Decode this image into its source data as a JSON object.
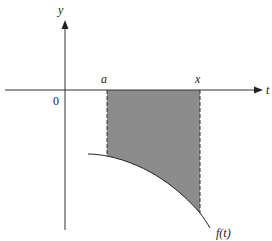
{
  "diagram": {
    "type": "area-under-curve",
    "axes": {
      "x_label": "t",
      "y_label": "y",
      "origin_label": "0"
    },
    "bounds": {
      "lower_label": "a",
      "upper_label": "x"
    },
    "curve": {
      "label": "f(t)",
      "description": "decreasing concave-down curve below the t-axis"
    },
    "shaded_region": {
      "description": "region between t-axis and f(t) from a to x",
      "fill_color": "#8c8c8c"
    },
    "colors": {
      "axis": "#333333",
      "curve": "#222222",
      "dashed_bounds": "#333333",
      "background": "#ffffff"
    }
  }
}
